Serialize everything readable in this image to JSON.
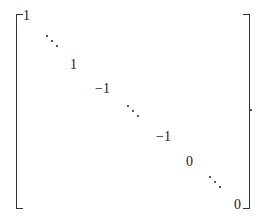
{
  "figure": {
    "type": "matrix",
    "diagonal": [
      "1",
      "⋱",
      "1",
      "−1",
      "⋱",
      "−1",
      "0",
      "⋱",
      "0"
    ],
    "entries": {
      "e1": "1",
      "e2": "1",
      "e3": "−1",
      "e4": "−1",
      "e5": "0",
      "e6": "0"
    },
    "trailing_punctuation": "."
  }
}
